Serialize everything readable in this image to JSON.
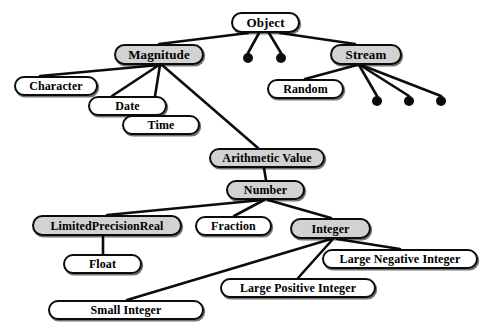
{
  "figure": {
    "title_fragment": "",
    "background_color": "#ffffff",
    "stroke_color": "#0c0c0c",
    "shaded_fill": "#d2d2d2",
    "plain_fill": "#ffffff",
    "width": 494,
    "height": 336
  },
  "nodes": [
    {
      "id": "object",
      "label": "Object",
      "x": 231,
      "y": 12,
      "w": 69,
      "h": 21,
      "font_size": 13,
      "shaded": false
    },
    {
      "id": "magnitude",
      "label": "Magnitude",
      "x": 114,
      "y": 44,
      "w": 90,
      "h": 21,
      "font_size": 13,
      "shaded": true
    },
    {
      "id": "stream",
      "label": "Stream",
      "x": 330,
      "y": 44,
      "w": 72,
      "h": 21,
      "font_size": 13,
      "shaded": true
    },
    {
      "id": "character",
      "label": "Character",
      "x": 14,
      "y": 76,
      "w": 84,
      "h": 20,
      "font_size": 12,
      "shaded": false
    },
    {
      "id": "random",
      "label": "Random",
      "x": 267,
      "y": 79,
      "w": 77,
      "h": 20,
      "font_size": 12,
      "shaded": false
    },
    {
      "id": "date",
      "label": "Date",
      "x": 88,
      "y": 96,
      "w": 79,
      "h": 20,
      "font_size": 12,
      "shaded": false
    },
    {
      "id": "time",
      "label": "Time",
      "x": 122,
      "y": 115,
      "w": 78,
      "h": 20,
      "font_size": 12,
      "shaded": false
    },
    {
      "id": "arithmetic-value",
      "label": "Arithmetic Value",
      "x": 209,
      "y": 148,
      "w": 116,
      "h": 20,
      "font_size": 12,
      "shaded": true
    },
    {
      "id": "number",
      "label": "Number",
      "x": 226,
      "y": 180,
      "w": 79,
      "h": 20,
      "font_size": 12,
      "shaded": true
    },
    {
      "id": "limited-precision-real",
      "label": "LimitedPrecisionReal",
      "x": 32,
      "y": 215,
      "w": 150,
      "h": 21,
      "font_size": 12,
      "shaded": true
    },
    {
      "id": "fraction",
      "label": "Fraction",
      "x": 195,
      "y": 216,
      "w": 77,
      "h": 20,
      "font_size": 12,
      "shaded": false
    },
    {
      "id": "integer",
      "label": "Integer",
      "x": 290,
      "y": 218,
      "w": 81,
      "h": 21,
      "font_size": 12,
      "shaded": true
    },
    {
      "id": "large-negative-integer",
      "label": "Large Negative Integer",
      "x": 322,
      "y": 249,
      "w": 156,
      "h": 20,
      "font_size": 12,
      "shaded": false
    },
    {
      "id": "float",
      "label": "Float",
      "x": 63,
      "y": 254,
      "w": 79,
      "h": 20,
      "font_size": 12,
      "shaded": false
    },
    {
      "id": "large-positive-integer",
      "label": "Large Positive Integer",
      "x": 220,
      "y": 278,
      "w": 156,
      "h": 20,
      "font_size": 12,
      "shaded": false
    },
    {
      "id": "small-integer",
      "label": "Small Integer",
      "x": 48,
      "y": 300,
      "w": 156,
      "h": 20,
      "font_size": 12,
      "shaded": false
    }
  ],
  "ellipsis_dots": [
    {
      "id": "object-dot-1",
      "parent": "object",
      "cx": 248,
      "cy": 58,
      "r": 5
    },
    {
      "id": "object-dot-2",
      "parent": "object",
      "cx": 281,
      "cy": 58,
      "r": 5
    },
    {
      "id": "stream-dot-1",
      "parent": "stream",
      "cx": 377,
      "cy": 101,
      "r": 5
    },
    {
      "id": "stream-dot-2",
      "parent": "stream",
      "cx": 409,
      "cy": 101,
      "r": 5
    },
    {
      "id": "stream-dot-3",
      "parent": "stream",
      "cx": 441,
      "cy": 101,
      "r": 5
    }
  ],
  "edges": [
    {
      "from": "object",
      "to": "magnitude",
      "x1": 248,
      "y1": 33,
      "x2": 159,
      "y2": 44
    },
    {
      "from": "object",
      "to": "object-dot-1",
      "x1": 259,
      "y1": 33,
      "x2": 248,
      "y2": 53
    },
    {
      "from": "object",
      "to": "object-dot-2",
      "x1": 269,
      "y1": 33,
      "x2": 281,
      "y2": 53
    },
    {
      "from": "object",
      "to": "stream",
      "x1": 280,
      "y1": 33,
      "x2": 355,
      "y2": 44
    },
    {
      "from": "magnitude",
      "to": "character",
      "x1": 159,
      "y1": 65,
      "x2": 40,
      "y2": 76
    },
    {
      "from": "magnitude",
      "to": "date",
      "x1": 159,
      "y1": 65,
      "x2": 112,
      "y2": 96
    },
    {
      "from": "magnitude",
      "to": "time",
      "x1": 160,
      "y1": 65,
      "x2": 152,
      "y2": 115
    },
    {
      "from": "magnitude",
      "to": "arithmetic-value",
      "x1": 162,
      "y1": 65,
      "x2": 258,
      "y2": 148
    },
    {
      "from": "stream",
      "to": "random",
      "x1": 357,
      "y1": 65,
      "x2": 305,
      "y2": 79
    },
    {
      "from": "stream",
      "to": "stream-dot-1",
      "x1": 359,
      "y1": 65,
      "x2": 377,
      "y2": 96
    },
    {
      "from": "stream",
      "to": "stream-dot-2",
      "x1": 360,
      "y1": 65,
      "x2": 409,
      "y2": 96
    },
    {
      "from": "stream",
      "to": "stream-dot-3",
      "x1": 361,
      "y1": 65,
      "x2": 441,
      "y2": 96
    },
    {
      "from": "arithmetic-value",
      "to": "number",
      "x1": 264,
      "y1": 168,
      "x2": 266,
      "y2": 180
    },
    {
      "from": "number",
      "to": "limited-precision-real",
      "x1": 262,
      "y1": 200,
      "x2": 107,
      "y2": 215
    },
    {
      "from": "number",
      "to": "fraction",
      "x1": 264,
      "y1": 200,
      "x2": 234,
      "y2": 216
    },
    {
      "from": "number",
      "to": "integer",
      "x1": 268,
      "y1": 200,
      "x2": 331,
      "y2": 218
    },
    {
      "from": "limited-precision-real",
      "to": "float",
      "x1": 103,
      "y1": 236,
      "x2": 103,
      "y2": 254
    },
    {
      "from": "integer",
      "to": "small-integer",
      "x1": 331,
      "y1": 239,
      "x2": 127,
      "y2": 300
    },
    {
      "from": "integer",
      "to": "large-positive-integer",
      "x1": 333,
      "y1": 239,
      "x2": 298,
      "y2": 278
    },
    {
      "from": "integer",
      "to": "large-negative-integer",
      "x1": 337,
      "y1": 239,
      "x2": 400,
      "y2": 249
    }
  ]
}
